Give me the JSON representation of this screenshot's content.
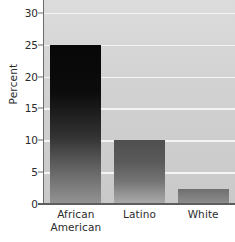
{
  "chart_data": {
    "type": "bar",
    "title": "",
    "subtitle": "",
    "xlabel": "",
    "ylabel": "Percent",
    "categories": [
      "African American",
      "Latino",
      "White"
    ],
    "category_lines": [
      [
        "African",
        "American"
      ],
      [
        "Latino"
      ],
      [
        "White"
      ]
    ],
    "values": [
      25,
      10,
      2.3
    ],
    "ylim": [
      0,
      32
    ],
    "yticks": [
      0,
      5,
      10,
      15,
      20,
      25,
      30
    ],
    "ytick_labels": [
      "0",
      "5",
      "10",
      "15",
      "20",
      "25",
      "30"
    ],
    "grid": "horizontal",
    "legend": "none",
    "annotations": [],
    "style": {
      "plot_background": "#d4d4d4",
      "gridline_color": "#f4f4f4",
      "axis_color": "#666666",
      "text_color": "#2b2b2b",
      "bar_colors": [
        "#0a0a0a",
        "#5e5e5e",
        "#7d7d7d"
      ]
    }
  }
}
